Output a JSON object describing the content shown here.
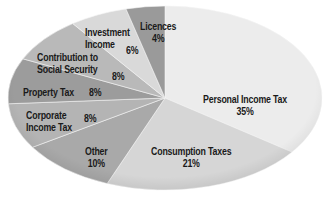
{
  "chart_data": {
    "type": "pie",
    "title": "",
    "style": "grayscale elliptical pie",
    "categories": [
      "Personal Income Tax",
      "Consumption Taxes",
      "Other",
      "Corporate Income Tax",
      "Property Tax",
      "Contribution to Social Security",
      "Investment Income",
      "Licences"
    ],
    "values": [
      35,
      21,
      10,
      8,
      8,
      8,
      6,
      4
    ],
    "unit": "%",
    "colors": [
      "#ececec",
      "#d6d6d6",
      "#a9a9a9",
      "#b4b4b4",
      "#9c9c9c",
      "#b9b9b9",
      "#d9d9d9",
      "#9a9a9a"
    ],
    "labels": [
      {
        "name": "Personal Income Tax",
        "pct": "35%"
      },
      {
        "name": "Consumption Taxes",
        "pct": "21%"
      },
      {
        "name": "Other",
        "pct": "10%"
      },
      {
        "name_lines": [
          "Corporate",
          "Income Tax"
        ],
        "pct": "8%"
      },
      {
        "name": "Property Tax",
        "pct": "8%"
      },
      {
        "name_lines": [
          "Contribution to",
          "Social Security"
        ],
        "pct": "8%"
      },
      {
        "name_lines": [
          "Investment",
          "Income"
        ],
        "pct": "6%"
      },
      {
        "name": "Licences",
        "pct": "4%"
      }
    ]
  }
}
